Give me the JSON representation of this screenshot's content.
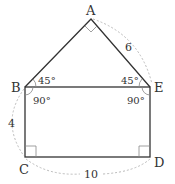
{
  "diagram": {
    "type": "geometry-figure",
    "points": {
      "A": {
        "label": "A",
        "x": 91,
        "y": 19
      },
      "B": {
        "label": "B",
        "x": 25,
        "y": 87
      },
      "E": {
        "label": "E",
        "x": 150,
        "y": 87
      },
      "C": {
        "label": "C",
        "x": 25,
        "y": 157
      },
      "D": {
        "label": "D",
        "x": 150,
        "y": 157
      }
    },
    "lengths": {
      "AE": "6",
      "BC": "4",
      "CD": "10"
    },
    "angles": {
      "ABE": "45°",
      "AEB": "45°",
      "EBC": "90°",
      "BED": "90°"
    },
    "right_angle_marks": [
      "A",
      "C",
      "D"
    ],
    "colors": {
      "stroke": "#333333",
      "dashed": "#bbbbbb",
      "text": "#333333"
    }
  }
}
